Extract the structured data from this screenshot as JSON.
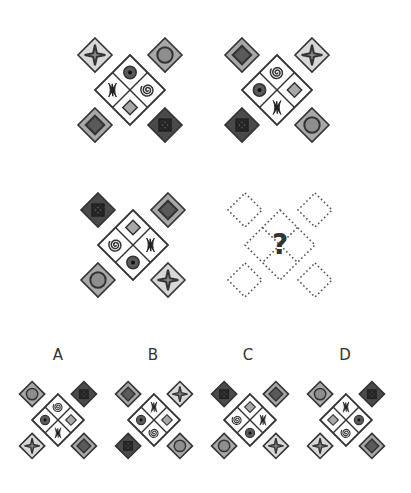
{
  "puzzle": {
    "title": "Visual reasoning matrix",
    "colors": {
      "outline": "#333333",
      "light": "#d8d8d8",
      "mid": "#a8a8a8",
      "dark": "#5a5a5a",
      "darker": "#4a4a4a",
      "white": "#ffffff",
      "dotted": "#555555"
    },
    "panels": [
      {
        "id": "panel-1",
        "cx": 130,
        "cy": 90,
        "size": 1.0,
        "center": {
          "top": "target-dot",
          "right": "spiral",
          "bottom": "gray-diamond",
          "left": "bowtie"
        },
        "corners": {
          "tl": "star",
          "tr": "circle",
          "bl": "nested-diamond",
          "br": "xbox"
        }
      },
      {
        "id": "panel-2",
        "cx": 277,
        "cy": 90,
        "size": 1.0,
        "center": {
          "top": "spiral",
          "right": "gray-diamond",
          "bottom": "bowtie",
          "left": "target-dot"
        },
        "corners": {
          "tl": "nested-diamond",
          "tr": "star",
          "bl": "xbox",
          "br": "circle"
        }
      },
      {
        "id": "panel-3",
        "cx": 133,
        "cy": 245,
        "size": 1.0,
        "center": {
          "top": "gray-diamond",
          "right": "bowtie",
          "bottom": "target-dot",
          "left": "spiral"
        },
        "corners": {
          "tl": "xbox",
          "tr": "nested-diamond",
          "bl": "circle",
          "br": "star"
        }
      },
      {
        "id": "panel-4",
        "cx": 280,
        "cy": 245,
        "size": 1.0,
        "placeholder": true,
        "question_mark": "?"
      }
    ],
    "options": [
      {
        "label": "A",
        "label_x": 58,
        "label_y": 346,
        "cx": 58,
        "cy": 420,
        "size": 0.74,
        "center": {
          "top": "spiral",
          "right": "gray-diamond",
          "bottom": "bowtie",
          "left": "target-dot"
        },
        "corners": {
          "tl": "circle",
          "tr": "xbox",
          "bl": "star",
          "br": "nested-diamond"
        }
      },
      {
        "label": "B",
        "label_x": 153,
        "label_y": 346,
        "cx": 154,
        "cy": 420,
        "size": 0.74,
        "center": {
          "top": "bowtie",
          "right": "gray-diamond",
          "bottom": "spiral",
          "left": "target-dot"
        },
        "corners": {
          "tl": "nested-diamond",
          "tr": "star",
          "bl": "xbox",
          "br": "circle"
        }
      },
      {
        "label": "C",
        "label_x": 248,
        "label_y": 346,
        "cx": 250,
        "cy": 420,
        "size": 0.74,
        "center": {
          "top": "gray-diamond",
          "right": "bowtie",
          "bottom": "target-dot",
          "left": "spiral"
        },
        "corners": {
          "tl": "xbox",
          "tr": "nested-diamond",
          "bl": "circle",
          "br": "star"
        }
      },
      {
        "label": "D",
        "label_x": 345,
        "label_y": 346,
        "cx": 346,
        "cy": 420,
        "size": 0.74,
        "center": {
          "top": "bowtie",
          "right": "target-dot",
          "bottom": "spiral",
          "left": "gray-diamond"
        },
        "corners": {
          "tl": "circle",
          "tr": "xbox",
          "bl": "star",
          "br": "nested-diamond"
        }
      }
    ]
  }
}
